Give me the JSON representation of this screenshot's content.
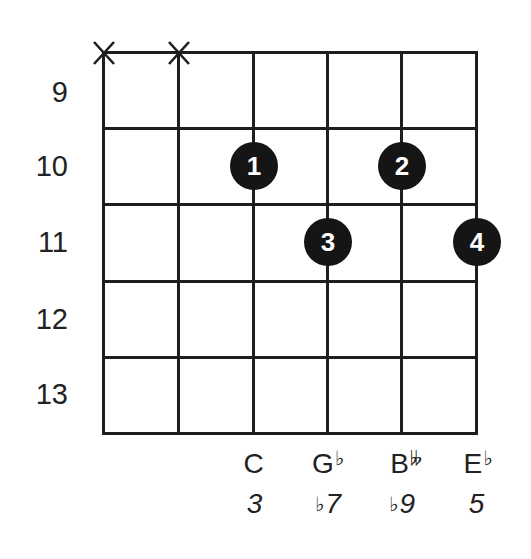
{
  "chord_diagram": {
    "fret_labels": [
      "9",
      "10",
      "11",
      "12",
      "13"
    ],
    "strings": 6,
    "frets_shown": 5,
    "muted_strings": [
      1,
      2
    ],
    "mute_symbol": "X",
    "fingers": [
      {
        "finger": "1",
        "string": 3,
        "fret": 10
      },
      {
        "finger": "2",
        "string": 5,
        "fret": 10
      },
      {
        "finger": "3",
        "string": 4,
        "fret": 11
      },
      {
        "finger": "4",
        "string": 6,
        "fret": 11
      }
    ],
    "notes": [
      {
        "string": 3,
        "name": "C",
        "accidental": ""
      },
      {
        "string": 4,
        "name": "G",
        "accidental": "♭"
      },
      {
        "string": 5,
        "name": "B",
        "accidental": "𝄫"
      },
      {
        "string": 6,
        "name": "E",
        "accidental": "♭"
      }
    ],
    "intervals": [
      {
        "string": 3,
        "accidental": "",
        "degree": "3"
      },
      {
        "string": 4,
        "accidental": "♭",
        "degree": "7"
      },
      {
        "string": 5,
        "accidental": "♭",
        "degree": "9"
      },
      {
        "string": 6,
        "accidental": "",
        "degree": "5"
      }
    ],
    "colors": {
      "line": "#1e1e1e",
      "dot": "#151515",
      "dot_text": "#ffffff",
      "background": "#ffffff"
    }
  }
}
